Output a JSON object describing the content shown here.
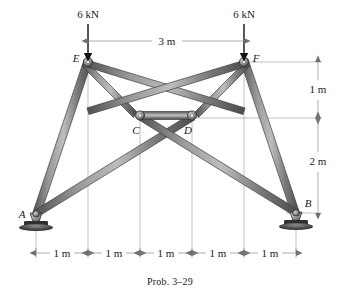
{
  "figure": {
    "caption": "Prob. 3–9",
    "caption_text": "Prob. 3–29",
    "background": "#ffffff",
    "member_color": "#7d7d7d",
    "member_edge_color": "#4a4a4a",
    "member_highlight_color": "#b9b9b9",
    "dimension_color": "#8a8a8a",
    "load_color": "#111111"
  },
  "loads": [
    {
      "id": "load-left",
      "label": "6 kN",
      "at_node": "E",
      "direction": "down"
    },
    {
      "id": "load-right",
      "label": "6 kN",
      "at_node": "F",
      "direction": "down"
    }
  ],
  "nodes": [
    {
      "id": "A",
      "label": "A",
      "support": "pin"
    },
    {
      "id": "B",
      "label": "B",
      "support": "pin"
    },
    {
      "id": "C",
      "label": "C",
      "support": "none"
    },
    {
      "id": "D",
      "label": "D",
      "support": "none"
    },
    {
      "id": "E",
      "label": "E",
      "support": "none"
    },
    {
      "id": "F",
      "label": "F",
      "support": "none"
    }
  ],
  "dimensions": {
    "top_span": {
      "label": "3 m",
      "between": [
        "E",
        "F"
      ]
    },
    "vertical": [
      {
        "label": "1 m",
        "order": 1
      },
      {
        "label": "2 m",
        "order": 2
      }
    ],
    "bottom_chain": [
      {
        "label": "1 m"
      },
      {
        "label": "1 m"
      },
      {
        "label": "1 m"
      },
      {
        "label": "1 m"
      },
      {
        "label": "1 m"
      }
    ]
  }
}
